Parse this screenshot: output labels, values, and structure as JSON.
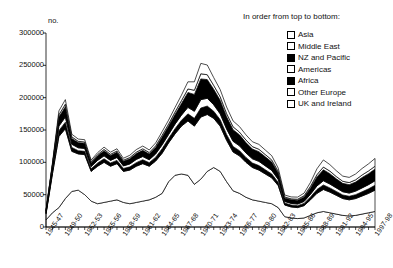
{
  "axis": {
    "y_unit": "no.",
    "y_ticks": [
      "300000",
      "250000",
      "200000",
      "150000",
      "100000",
      "50000",
      "0"
    ],
    "y_min": 0,
    "y_max": 300000,
    "x_ticks": [
      "1945-47",
      "1949-50",
      "1952-53",
      "1955-56",
      "1958-59",
      "1961-62",
      "1964-65",
      "1967-68",
      "1970-71",
      "1973-74",
      "1976-77",
      "1979-80",
      "1982-83",
      "1985-86",
      "1988-89",
      "1991-92",
      "1994-95",
      "1997-98"
    ]
  },
  "legend": {
    "title": "In order from top to bottom:",
    "items": [
      {
        "label": "Asia",
        "fill": "open"
      },
      {
        "label": "Middle East",
        "fill": "open"
      },
      {
        "label": "NZ and Pacific",
        "fill": "filled"
      },
      {
        "label": "Americas",
        "fill": "open"
      },
      {
        "label": "Africa",
        "fill": "filled"
      },
      {
        "label": "Other Europe",
        "fill": "open"
      },
      {
        "label": "UK and Ireland",
        "fill": "open"
      }
    ]
  },
  "chart_data": {
    "type": "area",
    "stacked": true,
    "title": "",
    "xlabel": "",
    "ylabel": "no.",
    "ylim": [
      0,
      300000
    ],
    "grid": false,
    "legend_position": "top-right",
    "legend_note": "In order from top to bottom:",
    "categories": [
      "1945-47",
      "1947-48",
      "1948-49",
      "1949-50",
      "1950-51",
      "1951-52",
      "1952-53",
      "1953-54",
      "1954-55",
      "1955-56",
      "1956-57",
      "1957-58",
      "1958-59",
      "1959-60",
      "1960-61",
      "1961-62",
      "1962-63",
      "1963-64",
      "1964-65",
      "1965-66",
      "1966-67",
      "1967-68",
      "1968-69",
      "1969-70",
      "1970-71",
      "1971-72",
      "1972-73",
      "1973-74",
      "1974-75",
      "1975-76",
      "1976-77",
      "1977-78",
      "1978-79",
      "1979-80",
      "1980-81",
      "1981-82",
      "1982-83",
      "1983-84",
      "1984-85",
      "1985-86",
      "1986-87",
      "1987-88",
      "1988-89",
      "1989-90",
      "1990-91",
      "1991-92",
      "1992-93",
      "1993-94",
      "1994-95",
      "1995-96",
      "1996-97",
      "1997-98"
    ],
    "stack_order_bottom_to_top": [
      "UK and Ireland",
      "Other Europe",
      "Africa",
      "Americas",
      "NZ and Pacific",
      "Middle East",
      "Asia"
    ],
    "series": [
      {
        "name": "UK and Ireland",
        "fill": "open",
        "values": [
          11000,
          22000,
          30000,
          44000,
          55000,
          57000,
          50000,
          40000,
          36000,
          38000,
          40000,
          42000,
          38000,
          36000,
          38000,
          40000,
          42000,
          46000,
          52000,
          70000,
          80000,
          82000,
          80000,
          66000,
          74000,
          86000,
          92000,
          86000,
          70000,
          56000,
          52000,
          46000,
          42000,
          40000,
          38000,
          36000,
          30000,
          16000,
          14000,
          13000,
          14000,
          18000,
          22000,
          24000,
          22000,
          20000,
          18000,
          17000,
          18000,
          20000,
          22000,
          24000
        ]
      },
      {
        "name": "Other Europe",
        "fill": "open",
        "values": [
          9000,
          60000,
          110000,
          108000,
          62000,
          56000,
          62000,
          46000,
          58000,
          62000,
          54000,
          56000,
          48000,
          52000,
          56000,
          58000,
          52000,
          56000,
          62000,
          60000,
          64000,
          74000,
          84000,
          90000,
          96000,
          88000,
          76000,
          70000,
          64000,
          60000,
          58000,
          54000,
          50000,
          48000,
          44000,
          40000,
          34000,
          18000,
          17000,
          17000,
          19000,
          24000,
          30000,
          34000,
          32000,
          29000,
          26000,
          25000,
          26000,
          28000,
          30000,
          33000
        ]
      },
      {
        "name": "Africa",
        "fill": "filled",
        "values": [
          1500,
          4000,
          9000,
          10000,
          6000,
          5000,
          5000,
          4000,
          5000,
          5500,
          5000,
          5000,
          4500,
          5000,
          5500,
          6000,
          5500,
          6000,
          7000,
          7000,
          8000,
          9000,
          11000,
          12000,
          14000,
          13000,
          11000,
          10000,
          9000,
          8500,
          8000,
          7500,
          7000,
          7000,
          6500,
          6000,
          5000,
          3000,
          3000,
          3000,
          3500,
          4500,
          6000,
          7000,
          6500,
          6000,
          5500,
          5500,
          6000,
          6500,
          7000,
          7500
        ]
      },
      {
        "name": "Americas",
        "fill": "open",
        "values": [
          1200,
          3000,
          7000,
          8000,
          5000,
          4500,
          4500,
          3500,
          4000,
          4500,
          4000,
          4500,
          4000,
          4500,
          5000,
          5000,
          4500,
          5000,
          6000,
          6000,
          7000,
          8000,
          10000,
          11000,
          13000,
          12000,
          10000,
          9000,
          8500,
          8000,
          7500,
          7000,
          6500,
          6500,
          6000,
          5500,
          4500,
          2500,
          2500,
          2500,
          3000,
          4000,
          5500,
          6500,
          6000,
          5500,
          5000,
          5000,
          5500,
          6000,
          6500,
          7000
        ]
      },
      {
        "name": "NZ and Pacific",
        "fill": "filled",
        "values": [
          2000,
          6000,
          14000,
          16000,
          9000,
          8000,
          8000,
          6000,
          7000,
          8000,
          7500,
          8000,
          7000,
          8000,
          9000,
          9500,
          9000,
          10000,
          12000,
          13000,
          15000,
          18000,
          23000,
          26000,
          32000,
          29000,
          24000,
          21000,
          19000,
          18000,
          17000,
          16000,
          15000,
          15000,
          14000,
          13000,
          10000,
          5500,
          5500,
          6000,
          7000,
          10000,
          14000,
          17000,
          16000,
          14000,
          13000,
          13000,
          14000,
          16000,
          17000,
          18000
        ]
      },
      {
        "name": "Middle East",
        "fill": "open",
        "values": [
          600,
          1500,
          3500,
          4000,
          2500,
          2000,
          2000,
          1500,
          2000,
          2000,
          2000,
          2000,
          1800,
          2000,
          2200,
          2500,
          2200,
          2500,
          3000,
          3200,
          3800,
          4500,
          5500,
          6500,
          8000,
          7500,
          6000,
          5500,
          5000,
          4500,
          4200,
          4000,
          3800,
          3800,
          3500,
          3200,
          2500,
          1500,
          1500,
          1500,
          1800,
          2500,
          3500,
          4200,
          4000,
          3600,
          3200,
          3200,
          3500,
          4000,
          4200,
          4500
        ]
      },
      {
        "name": "Asia",
        "fill": "open",
        "values": [
          800,
          2500,
          6000,
          7000,
          4000,
          3500,
          3500,
          2500,
          3000,
          3500,
          3200,
          3500,
          3000,
          3500,
          4000,
          4200,
          4000,
          4500,
          5500,
          6000,
          7000,
          8500,
          11000,
          13000,
          16000,
          15000,
          12000,
          11000,
          10000,
          9000,
          8500,
          8000,
          7500,
          7500,
          7000,
          6500,
          5000,
          3000,
          3000,
          3200,
          4000,
          6000,
          9000,
          11000,
          10000,
          9000,
          8000,
          8000,
          9000,
          10000,
          11000,
          12000
        ]
      }
    ],
    "notable_points": [
      {
        "label": "early peak",
        "x": "1949-50",
        "total_approx": 179500
      },
      {
        "label": "main peak",
        "x": "1970-71",
        "total_approx": 253000
      },
      {
        "label": "trough",
        "x": "1983-84",
        "total_approx": 49500
      },
      {
        "label": "end",
        "x": "1997-98",
        "total_approx": 106000
      }
    ]
  }
}
